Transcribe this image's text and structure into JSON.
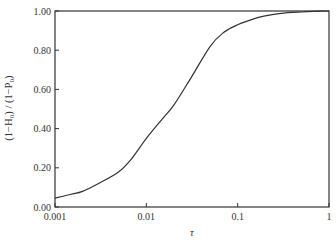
{
  "chart_data": {
    "type": "line",
    "title": "",
    "xlabel": "τ",
    "ylabel": "(1−H₀) / (1−P₀)",
    "xscale": "log",
    "xlim": [
      0.001,
      1
    ],
    "ylim": [
      0.0,
      1.0
    ],
    "grid": false,
    "legend": null,
    "x_ticks": [
      {
        "value": 0.001,
        "label": "0.001"
      },
      {
        "value": 0.01,
        "label": "0.01"
      },
      {
        "value": 0.1,
        "label": "0.1"
      },
      {
        "value": 1,
        "label": "1"
      }
    ],
    "y_ticks": [
      {
        "value": 0.0,
        "label": "0.00"
      },
      {
        "value": 0.2,
        "label": "0.20"
      },
      {
        "value": 0.4,
        "label": "0.40"
      },
      {
        "value": 0.6,
        "label": "0.60"
      },
      {
        "value": 0.8,
        "label": "0.80"
      },
      {
        "value": 1.0,
        "label": "1.00"
      }
    ],
    "series": [
      {
        "name": "(1−H₀)/(1−P₀)",
        "color": "#333333",
        "x": [
          0.001,
          0.0015,
          0.002,
          0.003,
          0.005,
          0.007,
          0.01,
          0.015,
          0.02,
          0.03,
          0.05,
          0.07,
          0.1,
          0.15,
          0.2,
          0.3,
          0.5,
          0.7,
          1.0
        ],
        "y": [
          0.045,
          0.065,
          0.08,
          0.12,
          0.18,
          0.25,
          0.35,
          0.45,
          0.52,
          0.65,
          0.82,
          0.89,
          0.93,
          0.96,
          0.975,
          0.988,
          0.995,
          0.998,
          1.0
        ]
      }
    ]
  }
}
